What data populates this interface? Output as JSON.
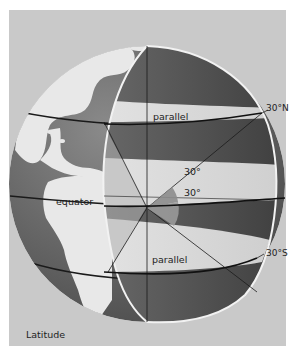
{
  "figure": {
    "caption": "Latitude",
    "labels": {
      "parallel_north": "parallel",
      "parallel_south": "parallel",
      "equator": "equator",
      "lat_north": "30°N",
      "lat_south": "30°S",
      "angle_north": "30°",
      "angle_south": "30°"
    },
    "latitudes_deg": {
      "north": 30,
      "south": -30,
      "equator": 0
    },
    "colors": {
      "page_background": "#ffffff",
      "panel_background": "#c9c9c9",
      "ocean": "#6e6e6e",
      "land": "#e6e6e6",
      "cut_dark": "#555555",
      "band_light": "#dcdcdc",
      "angle_wedge": "#8c8c8c",
      "line": "#1a1a1a"
    }
  }
}
